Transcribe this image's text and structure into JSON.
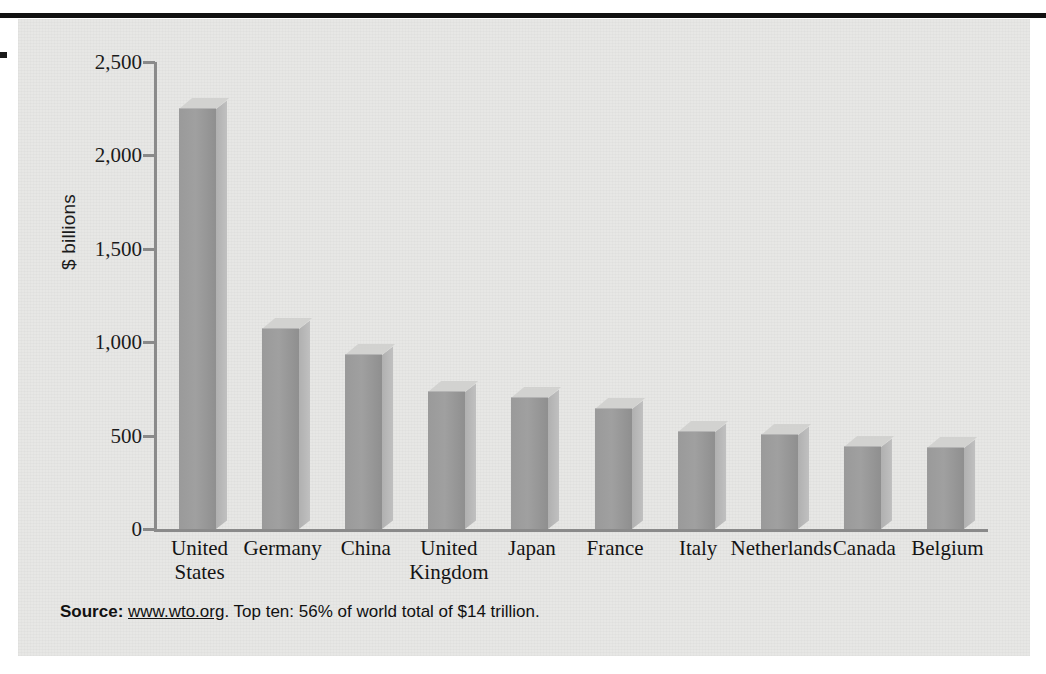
{
  "figure": {
    "source_prefix": "Source:",
    "source_url": "www.wto.org",
    "source_rest": ". Top ten: 56% of world total of $14 trillion."
  },
  "chart_data": {
    "type": "bar",
    "title": "",
    "subtitle": "",
    "xlabel": "",
    "ylabel": "$ billions",
    "categories": [
      "United States",
      "Germany",
      "China",
      "United Kingdom",
      "Japan",
      "France",
      "Italy",
      "Netherlands",
      "Canada",
      "Belgium"
    ],
    "category_lines": [
      [
        "United",
        "States"
      ],
      [
        "Germany",
        ""
      ],
      [
        "China",
        ""
      ],
      [
        "United",
        "Kingdom"
      ],
      [
        "Japan",
        ""
      ],
      [
        "France",
        ""
      ],
      [
        "Italy",
        ""
      ],
      [
        "Netherlands",
        ""
      ],
      [
        "Canada",
        ""
      ],
      [
        "Belgium",
        ""
      ]
    ],
    "values": [
      2250,
      1070,
      930,
      735,
      700,
      645,
      520,
      505,
      440,
      435
    ],
    "ylim": [
      0,
      2500
    ],
    "yticks": [
      0,
      500,
      1000,
      1500,
      2000,
      2500
    ],
    "ytick_labels": [
      "0",
      "500",
      "1,000",
      "1,500",
      "2,000",
      "2,500"
    ],
    "grid": false,
    "legend": null,
    "bar_color": "#9a9a9a",
    "bar_top_color": "#d2d2d0",
    "bar_side_color": "#bcbcbc",
    "panel_color": "#e7e7e5",
    "axis_color": "#8a8a8a",
    "text_color": "#141414"
  }
}
